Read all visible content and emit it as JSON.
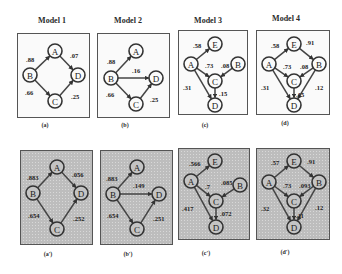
{
  "titles": [
    "Model 1",
    "Model 2",
    "Model 3",
    "Model 4"
  ],
  "panels": [
    {
      "id": "a",
      "caption": "(a)",
      "style": "white",
      "box": {
        "x": 17,
        "y": 33,
        "w": 73,
        "h": 85
      },
      "nodes": [
        {
          "id": "A",
          "x": 37,
          "y": 17
        },
        {
          "id": "B",
          "x": 12,
          "y": 41
        },
        {
          "id": "D",
          "x": 60,
          "y": 41
        },
        {
          "id": "C",
          "x": 37,
          "y": 67
        }
      ],
      "edges": [
        {
          "from": "B",
          "to": "A",
          "label": ".88",
          "lx": 8,
          "ly": 28
        },
        {
          "from": "A",
          "to": "D",
          "label": ".07",
          "lx": 52,
          "ly": 24
        },
        {
          "from": "B",
          "to": "C",
          "label": ".66",
          "lx": 7,
          "ly": 61
        },
        {
          "from": "C",
          "to": "D",
          "label": ".25",
          "lx": 53,
          "ly": 65
        }
      ]
    },
    {
      "id": "b",
      "caption": "(b)",
      "style": "white",
      "box": {
        "x": 97,
        "y": 33,
        "w": 73,
        "h": 85
      },
      "nodes": [
        {
          "id": "A",
          "x": 38,
          "y": 17
        },
        {
          "id": "B",
          "x": 13,
          "y": 44
        },
        {
          "id": "D",
          "x": 58,
          "y": 44
        },
        {
          "id": "C",
          "x": 38,
          "y": 70
        }
      ],
      "edges": [
        {
          "from": "B",
          "to": "A",
          "label": ".88",
          "lx": 9,
          "ly": 30
        },
        {
          "from": "B",
          "to": "D",
          "label": ".16",
          "lx": 34,
          "ly": 39
        },
        {
          "from": "B",
          "to": "C",
          "label": ".66",
          "lx": 8,
          "ly": 63
        },
        {
          "from": "C",
          "to": "D",
          "label": ".25",
          "lx": 52,
          "ly": 68
        }
      ]
    },
    {
      "id": "c",
      "caption": "(c)",
      "style": "white",
      "box": {
        "x": 178,
        "y": 30,
        "w": 70,
        "h": 85
      },
      "nodes": [
        {
          "id": "E",
          "x": 36,
          "y": 13
        },
        {
          "id": "A",
          "x": 12,
          "y": 33
        },
        {
          "id": "B",
          "x": 59,
          "y": 33
        },
        {
          "id": "C",
          "x": 36,
          "y": 50
        },
        {
          "id": "D",
          "x": 36,
          "y": 74
        }
      ],
      "edges": [
        {
          "from": "A",
          "to": "E",
          "label": ".58",
          "lx": 14,
          "ly": 17
        },
        {
          "from": "A",
          "to": "C",
          "label": ".73",
          "lx": 26,
          "ly": 37
        },
        {
          "from": "B",
          "to": "C",
          "label": ".08",
          "lx": 42,
          "ly": 37
        },
        {
          "from": "A",
          "to": "D",
          "label": ".31",
          "lx": 4,
          "ly": 59
        },
        {
          "from": "C",
          "to": "D",
          "label": ".15",
          "lx": 40,
          "ly": 65
        }
      ]
    },
    {
      "id": "d",
      "caption": "(d)",
      "style": "white",
      "box": {
        "x": 256,
        "y": 30,
        "w": 74,
        "h": 85
      },
      "nodes": [
        {
          "id": "E",
          "x": 37,
          "y": 13
        },
        {
          "id": "A",
          "x": 12,
          "y": 33
        },
        {
          "id": "B",
          "x": 62,
          "y": 33
        },
        {
          "id": "C",
          "x": 37,
          "y": 50
        },
        {
          "id": "D",
          "x": 37,
          "y": 74
        }
      ],
      "edges": [
        {
          "from": "A",
          "to": "E",
          "label": ".58",
          "lx": 14,
          "ly": 17
        },
        {
          "from": "E",
          "to": "B",
          "label": ".91",
          "lx": 49,
          "ly": 14
        },
        {
          "from": "A",
          "to": "C",
          "label": ".73",
          "lx": 26,
          "ly": 38
        },
        {
          "from": "B",
          "to": "C",
          "label": ".08",
          "lx": 43,
          "ly": 38
        },
        {
          "from": "A",
          "to": "D",
          "label": ".31",
          "lx": 4,
          "ly": 59
        },
        {
          "from": "B",
          "to": "D",
          "label": ".12",
          "lx": 58,
          "ly": 59
        },
        {
          "from": "C",
          "to": "D",
          "label": ".15",
          "lx": 39,
          "ly": 66
        }
      ]
    },
    {
      "id": "a_prime",
      "caption": "(a')",
      "style": "gray",
      "box": {
        "x": 20,
        "y": 150,
        "w": 73,
        "h": 95
      },
      "nodes": [
        {
          "id": "A",
          "x": 36,
          "y": 16
        },
        {
          "id": "B",
          "x": 12,
          "y": 42
        },
        {
          "id": "D",
          "x": 60,
          "y": 42
        },
        {
          "id": "C",
          "x": 36,
          "y": 78
        }
      ],
      "edges": [
        {
          "from": "B",
          "to": "A",
          "label": ".883",
          "lx": 6,
          "ly": 29
        },
        {
          "from": "A",
          "to": "D",
          "label": ".056",
          "lx": 51,
          "ly": 26
        },
        {
          "from": "B",
          "to": "C",
          "label": ".654",
          "lx": 7,
          "ly": 67
        },
        {
          "from": "C",
          "to": "D",
          "label": ".252",
          "lx": 52,
          "ly": 70
        }
      ]
    },
    {
      "id": "b_prime",
      "caption": "(b')",
      "style": "gray",
      "box": {
        "x": 100,
        "y": 150,
        "w": 73,
        "h": 95
      },
      "nodes": [
        {
          "id": "A",
          "x": 36,
          "y": 16
        },
        {
          "id": "B",
          "x": 12,
          "y": 43
        },
        {
          "id": "D",
          "x": 58,
          "y": 43
        },
        {
          "id": "C",
          "x": 36,
          "y": 78
        }
      ],
      "edges": [
        {
          "from": "B",
          "to": "A",
          "label": ".883",
          "lx": 5,
          "ly": 30
        },
        {
          "from": "B",
          "to": "D",
          "label": ".149",
          "lx": 32,
          "ly": 37
        },
        {
          "from": "B",
          "to": "C",
          "label": ".654",
          "lx": 6,
          "ly": 67
        },
        {
          "from": "C",
          "to": "D",
          "label": ".251",
          "lx": 52,
          "ly": 70
        }
      ]
    },
    {
      "id": "c_prime",
      "caption": "(c')",
      "style": "gray",
      "box": {
        "x": 178,
        "y": 148,
        "w": 72,
        "h": 92
      },
      "nodes": [
        {
          "id": "E",
          "x": 36,
          "y": 12
        },
        {
          "id": "A",
          "x": 12,
          "y": 32
        },
        {
          "id": "B",
          "x": 61,
          "y": 36
        },
        {
          "id": "C",
          "x": 37,
          "y": 52
        },
        {
          "id": "D",
          "x": 37,
          "y": 78
        }
      ],
      "edges": [
        {
          "from": "A",
          "to": "E",
          "label": ".566",
          "lx": 10,
          "ly": 17
        },
        {
          "from": "A",
          "to": "C",
          "label": ".7",
          "lx": 26,
          "ly": 40
        },
        {
          "from": "B",
          "to": "C",
          "label": ".085",
          "lx": 42,
          "ly": 36
        },
        {
          "from": "A",
          "to": "D",
          "label": ".417",
          "lx": 3,
          "ly": 62
        },
        {
          "from": "C",
          "to": "D",
          "label": ".072",
          "lx": 41,
          "ly": 67
        }
      ]
    },
    {
      "id": "d_prime",
      "caption": "(d')",
      "style": "gray",
      "box": {
        "x": 256,
        "y": 148,
        "w": 74,
        "h": 92
      },
      "nodes": [
        {
          "id": "E",
          "x": 37,
          "y": 12
        },
        {
          "id": "A",
          "x": 12,
          "y": 33
        },
        {
          "id": "B",
          "x": 62,
          "y": 33
        },
        {
          "id": "C",
          "x": 37,
          "y": 52
        },
        {
          "id": "D",
          "x": 37,
          "y": 78
        }
      ],
      "edges": [
        {
          "from": "A",
          "to": "E",
          "label": ".57",
          "lx": 14,
          "ly": 16
        },
        {
          "from": "E",
          "to": "B",
          "label": ".91",
          "lx": 50,
          "ly": 15
        },
        {
          "from": "A",
          "to": "C",
          "label": ".73",
          "lx": 26,
          "ly": 39
        },
        {
          "from": "B",
          "to": "C",
          "label": ".093",
          "lx": 42,
          "ly": 39
        },
        {
          "from": "A",
          "to": "D",
          "label": ".32",
          "lx": 4,
          "ly": 62
        },
        {
          "from": "B",
          "to": "D",
          "label": ".12",
          "lx": 58,
          "ly": 61
        },
        {
          "from": "C",
          "to": "D",
          "label": ".11",
          "lx": 39,
          "ly": 69
        }
      ]
    }
  ],
  "title_positions": [
    {
      "x": 17,
      "y": 16
    },
    {
      "x": 93,
      "y": 16
    },
    {
      "x": 173,
      "y": 16
    },
    {
      "x": 251,
      "y": 14
    }
  ],
  "caption_positions": [
    {
      "x": 38,
      "y": 122
    },
    {
      "x": 118,
      "y": 122
    },
    {
      "x": 198,
      "y": 122
    },
    {
      "x": 278,
      "y": 120
    },
    {
      "x": 41,
      "y": 251
    },
    {
      "x": 121,
      "y": 251
    },
    {
      "x": 199,
      "y": 250
    },
    {
      "x": 278,
      "y": 249
    }
  ]
}
